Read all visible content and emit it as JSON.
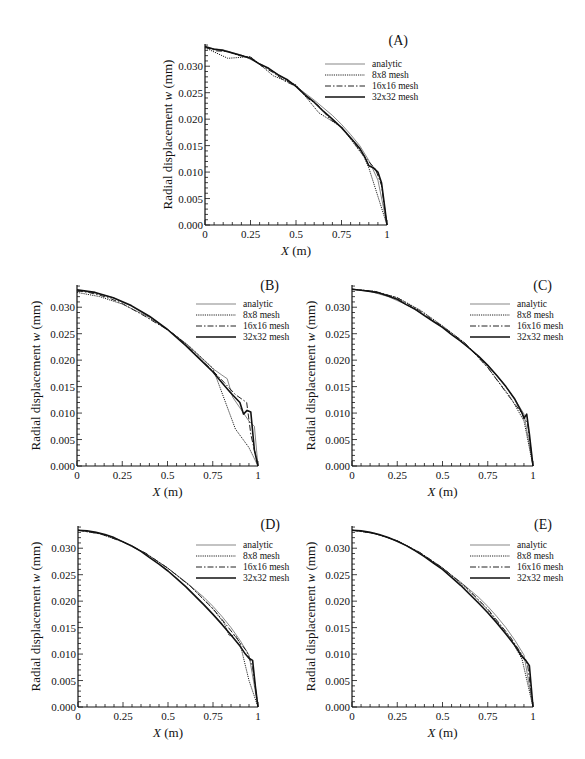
{
  "figure": {
    "panel_ids": [
      "A",
      "B",
      "C",
      "D",
      "E"
    ]
  },
  "chart_data": [
    {
      "type": "line",
      "panel_label": "(A)",
      "title": "",
      "xlabel_var": "X",
      "xlabel_unit": " (m)",
      "ylabel": "Radial displacement",
      "ylabel_var": "w",
      "ylabel_unit": "(mm)",
      "xlim": [
        0,
        1
      ],
      "ylim": [
        0,
        0.0342
      ],
      "x_ticks": [
        0,
        0.25,
        0.5,
        0.75,
        1
      ],
      "x_tick_labels": [
        "0",
        "0.25",
        "0.5",
        "0.75",
        "1"
      ],
      "y_ticks": [
        0,
        0.005,
        0.01,
        0.015,
        0.02,
        0.025,
        0.03
      ],
      "y_tick_labels": [
        "0.000",
        "0.005",
        "0.010",
        "0.015",
        "0.020",
        "0.025",
        "0.030"
      ],
      "grid": false,
      "legend_position": "top-right",
      "series": [
        {
          "name": "analytic",
          "style": "thin",
          "x": [
            0,
            0.1,
            0.2,
            0.3,
            0.4,
            0.5,
            0.6,
            0.7,
            0.75,
            0.8,
            0.85,
            0.9,
            0.95,
            1.0
          ],
          "y": [
            0.0335,
            0.0331,
            0.0321,
            0.0305,
            0.0285,
            0.0262,
            0.0236,
            0.0207,
            0.019,
            0.0171,
            0.015,
            0.0122,
            0.0085,
            0.0
          ]
        },
        {
          "name": "8x8 mesh",
          "style": "dotted",
          "x": [
            0,
            0.125,
            0.25,
            0.375,
            0.5,
            0.625,
            0.75,
            0.875,
            0.9,
            1.0
          ],
          "y": [
            0.0335,
            0.0315,
            0.0318,
            0.0282,
            0.0265,
            0.0212,
            0.0185,
            0.0128,
            0.0108,
            0.0
          ]
        },
        {
          "name": "16x16 mesh",
          "style": "dashdot",
          "x": [
            0,
            0.0625,
            0.125,
            0.1875,
            0.25,
            0.3125,
            0.375,
            0.4375,
            0.5,
            0.5625,
            0.625,
            0.6875,
            0.75,
            0.8125,
            0.875,
            0.9375,
            0.97,
            1.0
          ],
          "y": [
            0.0336,
            0.0329,
            0.0328,
            0.032,
            0.0317,
            0.03,
            0.0288,
            0.0272,
            0.0262,
            0.024,
            0.0225,
            0.02,
            0.0185,
            0.0158,
            0.013,
            0.0105,
            0.0075,
            0.0
          ]
        },
        {
          "name": "32x32 mesh",
          "style": "thick",
          "x": [
            0,
            0.05,
            0.1,
            0.15,
            0.2,
            0.25,
            0.3,
            0.35,
            0.4,
            0.45,
            0.5,
            0.55,
            0.6,
            0.65,
            0.7,
            0.75,
            0.8,
            0.85,
            0.875,
            0.9,
            0.925,
            0.95,
            0.97,
            0.985,
            1.0
          ],
          "y": [
            0.0337,
            0.0332,
            0.033,
            0.0325,
            0.032,
            0.0315,
            0.0304,
            0.0296,
            0.0284,
            0.0275,
            0.0262,
            0.0246,
            0.0232,
            0.0215,
            0.02,
            0.0184,
            0.0165,
            0.0145,
            0.013,
            0.0112,
            0.0108,
            0.01,
            0.008,
            0.004,
            0.0
          ]
        }
      ],
      "legend": [
        "analytic",
        "8x8 mesh",
        "16x16 mesh",
        "32x32 mesh"
      ]
    },
    {
      "type": "line",
      "panel_label": "(B)",
      "title": "",
      "xlabel_var": "X",
      "xlabel_unit": " (m)",
      "ylabel": "Radial displacement",
      "ylabel_var": "w",
      "ylabel_unit": "(mm)",
      "xlim": [
        0,
        1
      ],
      "ylim": [
        0,
        0.0342
      ],
      "x_ticks": [
        0,
        0.25,
        0.5,
        0.75,
        1
      ],
      "x_tick_labels": [
        "0",
        "0.25",
        "0.5",
        "0.75",
        "1"
      ],
      "y_ticks": [
        0,
        0.005,
        0.01,
        0.015,
        0.02,
        0.025,
        0.03
      ],
      "y_tick_labels": [
        "0.000",
        "0.005",
        "0.010",
        "0.015",
        "0.020",
        "0.025",
        "0.030"
      ],
      "grid": false,
      "legend_position": "top-right",
      "series": [
        {
          "name": "analytic",
          "style": "thin",
          "x": [
            0,
            0.1,
            0.2,
            0.3,
            0.4,
            0.5,
            0.6,
            0.7,
            0.75,
            0.8,
            0.83,
            0.86,
            0.9,
            0.95,
            0.98,
            1.0
          ],
          "y": [
            0.0332,
            0.0327,
            0.0318,
            0.0302,
            0.0282,
            0.0258,
            0.0232,
            0.02,
            0.0184,
            0.0172,
            0.0165,
            0.013,
            0.011,
            0.0085,
            0.0075,
            0.0
          ]
        },
        {
          "name": "8x8 mesh",
          "style": "dotted",
          "x": [
            0,
            0.125,
            0.25,
            0.375,
            0.5,
            0.625,
            0.75,
            0.875,
            0.95,
            1.0
          ],
          "y": [
            0.0328,
            0.032,
            0.0306,
            0.0285,
            0.0258,
            0.0225,
            0.0185,
            0.007,
            0.0035,
            0.0
          ]
        },
        {
          "name": "16x16 mesh",
          "style": "dashdot",
          "x": [
            0,
            0.0625,
            0.125,
            0.1875,
            0.25,
            0.3125,
            0.375,
            0.4375,
            0.5,
            0.5625,
            0.625,
            0.6875,
            0.75,
            0.8125,
            0.875,
            0.9375,
            0.96,
            1.0
          ],
          "y": [
            0.0331,
            0.0328,
            0.0323,
            0.0316,
            0.0307,
            0.0295,
            0.0283,
            0.027,
            0.0258,
            0.0242,
            0.0222,
            0.02,
            0.018,
            0.0158,
            0.0135,
            0.012,
            0.006,
            0.0
          ]
        },
        {
          "name": "32x32 mesh",
          "style": "thick",
          "x": [
            0,
            0.1,
            0.2,
            0.3,
            0.4,
            0.5,
            0.6,
            0.7,
            0.75,
            0.8,
            0.85,
            0.9,
            0.92,
            0.94,
            0.96,
            0.98,
            1.0
          ],
          "y": [
            0.0333,
            0.0328,
            0.0318,
            0.0303,
            0.0283,
            0.0258,
            0.0228,
            0.0195,
            0.0178,
            0.0158,
            0.0138,
            0.012,
            0.0098,
            0.0105,
            0.0102,
            0.003,
            0.0
          ]
        }
      ],
      "legend": [
        "analytic",
        "8x8 mesh",
        "16x16 mesh",
        "32x32 mesh"
      ]
    },
    {
      "type": "line",
      "panel_label": "(C)",
      "title": "",
      "xlabel_var": "X",
      "xlabel_unit": " (m)",
      "ylabel": "Radial displacement",
      "ylabel_var": "w",
      "ylabel_unit": "(mm)",
      "xlim": [
        0,
        1
      ],
      "ylim": [
        0,
        0.0342
      ],
      "x_ticks": [
        0,
        0.25,
        0.5,
        0.75,
        1
      ],
      "x_tick_labels": [
        "0",
        "0.25",
        "0.5",
        "0.75",
        "1"
      ],
      "y_ticks": [
        0,
        0.005,
        0.01,
        0.015,
        0.02,
        0.025,
        0.03
      ],
      "y_tick_labels": [
        "0.000",
        "0.005",
        "0.010",
        "0.015",
        "0.020",
        "0.025",
        "0.030"
      ],
      "grid": false,
      "legend_position": "top-right",
      "series": [
        {
          "name": "analytic",
          "style": "thin",
          "x": [
            0,
            0.1,
            0.2,
            0.3,
            0.4,
            0.5,
            0.6,
            0.7,
            0.75,
            0.8,
            0.85,
            0.9,
            0.95,
            1.0
          ],
          "y": [
            0.0334,
            0.033,
            0.032,
            0.0305,
            0.0285,
            0.0262,
            0.0236,
            0.0207,
            0.019,
            0.0171,
            0.015,
            0.0126,
            0.0098,
            0.0
          ]
        },
        {
          "name": "8x8 mesh",
          "style": "dotted",
          "x": [
            0,
            0.125,
            0.25,
            0.375,
            0.5,
            0.625,
            0.75,
            0.875,
            0.95,
            1.0
          ],
          "y": [
            0.0334,
            0.033,
            0.0318,
            0.0295,
            0.0265,
            0.0232,
            0.0186,
            0.013,
            0.0085,
            0.0
          ]
        },
        {
          "name": "16x16 mesh",
          "style": "dashdot",
          "x": [
            0,
            0.125,
            0.25,
            0.375,
            0.5,
            0.625,
            0.75,
            0.875,
            0.9375,
            0.97,
            1.0
          ],
          "y": [
            0.0334,
            0.033,
            0.0318,
            0.0293,
            0.0264,
            0.0232,
            0.0186,
            0.0128,
            0.01,
            0.008,
            0.0
          ]
        },
        {
          "name": "32x32 mesh",
          "style": "thick",
          "x": [
            0,
            0.05,
            0.1,
            0.15,
            0.2,
            0.25,
            0.3,
            0.35,
            0.4,
            0.45,
            0.5,
            0.55,
            0.6,
            0.65,
            0.7,
            0.75,
            0.8,
            0.85,
            0.9,
            0.94,
            0.95,
            0.965,
            0.98,
            1.0
          ],
          "y": [
            0.0334,
            0.0332,
            0.033,
            0.0327,
            0.0321,
            0.0315,
            0.0305,
            0.0296,
            0.0284,
            0.0273,
            0.0262,
            0.0248,
            0.0236,
            0.0222,
            0.0207,
            0.019,
            0.0171,
            0.015,
            0.0126,
            0.01,
            0.009,
            0.0098,
            0.006,
            0.0
          ]
        }
      ],
      "legend": [
        "analytic",
        "8x8 mesh",
        "16x16 mesh",
        "32x32 mesh"
      ]
    },
    {
      "type": "line",
      "panel_label": "(D)",
      "title": "",
      "xlabel_var": "X",
      "xlabel_unit": " (m)",
      "ylabel": "Radial displacement",
      "ylabel_var": "w",
      "ylabel_unit": "(mm)",
      "xlim": [
        0,
        1
      ],
      "ylim": [
        0,
        0.0342
      ],
      "x_ticks": [
        0,
        0.25,
        0.5,
        0.75,
        1
      ],
      "x_tick_labels": [
        "0",
        "0.25",
        "0.5",
        "0.75",
        "1"
      ],
      "y_ticks": [
        0,
        0.005,
        0.01,
        0.015,
        0.02,
        0.025,
        0.03
      ],
      "y_tick_labels": [
        "0.000",
        "0.005",
        "0.010",
        "0.015",
        "0.020",
        "0.025",
        "0.030"
      ],
      "grid": false,
      "legend_position": "top-right",
      "series": [
        {
          "name": "analytic",
          "style": "thin",
          "x": [
            0,
            0.1,
            0.2,
            0.3,
            0.4,
            0.5,
            0.6,
            0.7,
            0.75,
            0.8,
            0.85,
            0.9,
            0.95,
            1.0
          ],
          "y": [
            0.0334,
            0.033,
            0.032,
            0.0305,
            0.0285,
            0.0262,
            0.0236,
            0.0207,
            0.019,
            0.0171,
            0.015,
            0.0126,
            0.0098,
            0.0
          ]
        },
        {
          "name": "8x8 mesh",
          "style": "dotted",
          "x": [
            0,
            0.125,
            0.25,
            0.375,
            0.5,
            0.625,
            0.75,
            0.8125,
            0.84,
            0.875,
            0.9,
            0.95,
            1.0
          ],
          "y": [
            0.0334,
            0.0327,
            0.0312,
            0.029,
            0.0262,
            0.0228,
            0.0185,
            0.0158,
            0.0135,
            0.0135,
            0.012,
            0.005,
            0.0
          ]
        },
        {
          "name": "16x16 mesh",
          "style": "dashdot",
          "x": [
            0,
            0.125,
            0.25,
            0.375,
            0.5,
            0.625,
            0.75,
            0.8125,
            0.875,
            0.9375,
            0.97,
            1.0
          ],
          "y": [
            0.0334,
            0.0327,
            0.0312,
            0.0291,
            0.0262,
            0.0228,
            0.0186,
            0.016,
            0.0133,
            0.0105,
            0.0075,
            0.0
          ]
        },
        {
          "name": "32x32 mesh",
          "style": "thick",
          "x": [
            0,
            0.05,
            0.1,
            0.15,
            0.2,
            0.25,
            0.3,
            0.35,
            0.4,
            0.45,
            0.5,
            0.55,
            0.6,
            0.65,
            0.7,
            0.75,
            0.8,
            0.85,
            0.9,
            0.93,
            0.95,
            0.97,
            0.985,
            1.0
          ],
          "y": [
            0.0334,
            0.0333,
            0.033,
            0.0326,
            0.032,
            0.0312,
            0.0304,
            0.0294,
            0.0282,
            0.027,
            0.0257,
            0.0242,
            0.0227,
            0.021,
            0.0193,
            0.0175,
            0.0156,
            0.0136,
            0.0115,
            0.01,
            0.0092,
            0.0088,
            0.004,
            0.0
          ]
        }
      ],
      "legend": [
        "analytic",
        "8x8 mesh",
        "16x16 mesh",
        "32x32 mesh"
      ]
    },
    {
      "type": "line",
      "panel_label": "(E)",
      "title": "",
      "xlabel_var": "X",
      "xlabel_unit": " (m)",
      "ylabel": "Radial displacement",
      "ylabel_var": "w",
      "ylabel_unit": "(mm)",
      "xlim": [
        0,
        1
      ],
      "ylim": [
        0,
        0.0342
      ],
      "x_ticks": [
        0,
        0.25,
        0.5,
        0.75,
        1
      ],
      "x_tick_labels": [
        "0",
        "0.25",
        "0.5",
        "0.75",
        "1"
      ],
      "y_ticks": [
        0,
        0.005,
        0.01,
        0.015,
        0.02,
        0.025,
        0.03
      ],
      "y_tick_labels": [
        "0.000",
        "0.005",
        "0.010",
        "0.015",
        "0.020",
        "0.025",
        "0.030"
      ],
      "grid": false,
      "legend_position": "top-right",
      "series": [
        {
          "name": "analytic",
          "style": "thin",
          "x": [
            0,
            0.1,
            0.2,
            0.3,
            0.4,
            0.5,
            0.6,
            0.7,
            0.75,
            0.8,
            0.85,
            0.9,
            0.95,
            1.0
          ],
          "y": [
            0.0334,
            0.033,
            0.032,
            0.0305,
            0.0285,
            0.0262,
            0.0236,
            0.0207,
            0.019,
            0.0171,
            0.015,
            0.0126,
            0.0098,
            0.0
          ]
        },
        {
          "name": "8x8 mesh",
          "style": "dotted",
          "x": [
            0,
            0.125,
            0.25,
            0.375,
            0.5,
            0.625,
            0.75,
            0.875,
            0.94,
            1.0
          ],
          "y": [
            0.0334,
            0.0328,
            0.0314,
            0.0292,
            0.0263,
            0.0226,
            0.0183,
            0.013,
            0.009,
            0.0
          ]
        },
        {
          "name": "16x16 mesh",
          "style": "dashdot",
          "x": [
            0,
            0.125,
            0.25,
            0.375,
            0.5,
            0.625,
            0.75,
            0.875,
            0.9375,
            0.97,
            1.0
          ],
          "y": [
            0.0334,
            0.0328,
            0.0314,
            0.0292,
            0.0263,
            0.0228,
            0.0185,
            0.0132,
            0.01,
            0.008,
            0.0
          ]
        },
        {
          "name": "32x32 mesh",
          "style": "thick",
          "x": [
            0,
            0.05,
            0.1,
            0.15,
            0.2,
            0.25,
            0.3,
            0.35,
            0.4,
            0.45,
            0.5,
            0.55,
            0.6,
            0.65,
            0.7,
            0.75,
            0.8,
            0.85,
            0.9,
            0.94,
            0.96,
            0.98,
            1.0
          ],
          "y": [
            0.0334,
            0.0333,
            0.033,
            0.0326,
            0.032,
            0.0313,
            0.0305,
            0.0295,
            0.0284,
            0.0272,
            0.026,
            0.0245,
            0.023,
            0.0213,
            0.0196,
            0.0178,
            0.0159,
            0.0138,
            0.0116,
            0.0095,
            0.0088,
            0.0078,
            0.0
          ]
        }
      ],
      "legend": [
        "analytic",
        "8x8 mesh",
        "16x16 mesh",
        "32x32 mesh"
      ]
    }
  ]
}
